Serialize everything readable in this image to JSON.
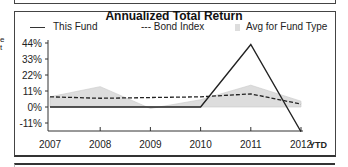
{
  "side_text": [
    "e",
    "t"
  ],
  "chart_data": {
    "type": "line",
    "title": "Annualized Total Return",
    "categories": [
      "2007",
      "2008",
      "2009",
      "2010",
      "2011",
      "2012"
    ],
    "x_suffix": "YTD",
    "series": [
      {
        "name": "This Fund",
        "style": "solid",
        "values": [
          0,
          0,
          0,
          0,
          43,
          -17
        ]
      },
      {
        "name": "Bond Index",
        "style": "dashed",
        "values": [
          7,
          6,
          6.5,
          7,
          9,
          2
        ]
      },
      {
        "name": "Avg for Fund Type",
        "style": "area",
        "values": [
          7,
          14,
          -1,
          5,
          15,
          4
        ]
      }
    ],
    "yticks": [
      "44%",
      "33%",
      "22%",
      "11%",
      "0%",
      "-11%"
    ],
    "ylim": [
      -17,
      44
    ],
    "legend_position": "top"
  },
  "legend": {
    "fund": "This Fund",
    "bond": "--- Bond Index",
    "avg": "Avg for Fund Type"
  },
  "colors": {
    "fund": "#222222",
    "bond": "#222222",
    "avg": "#dddddd"
  }
}
